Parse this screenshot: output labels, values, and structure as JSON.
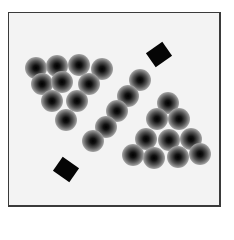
{
  "figure": {
    "frame": {
      "x": 8,
      "y": 12,
      "width": 213,
      "height": 195,
      "border_color": "#3a3a3a",
      "fill": "#f3f3f3"
    },
    "groups": [
      {
        "name": "left-triangle-cluster",
        "dots": [
          [
            36,
            68
          ],
          [
            57,
            66
          ],
          [
            79,
            65
          ],
          [
            102,
            69
          ],
          [
            42,
            84
          ],
          [
            62,
            82
          ],
          [
            89,
            84
          ],
          [
            52,
            101
          ],
          [
            77,
            101
          ],
          [
            66,
            120
          ]
        ]
      },
      {
        "name": "diagonal-line",
        "dots": [
          [
            140,
            80
          ],
          [
            128,
            96
          ],
          [
            117,
            111
          ],
          [
            106,
            127
          ],
          [
            93,
            141
          ]
        ]
      },
      {
        "name": "right-triangle-cluster",
        "dots": [
          [
            168,
            103
          ],
          [
            157,
            119
          ],
          [
            179,
            119
          ],
          [
            146,
            139
          ],
          [
            169,
            140
          ],
          [
            191,
            139
          ],
          [
            133,
            155
          ],
          [
            154,
            158
          ],
          [
            178,
            157
          ],
          [
            200,
            154
          ]
        ]
      }
    ],
    "diamonds": [
      {
        "cx": 159,
        "cy": 54,
        "rotate": -35
      },
      {
        "cx": 66,
        "cy": 169,
        "rotate": 35
      }
    ],
    "dot_color": "#000000",
    "diamond_color": "#050505"
  }
}
